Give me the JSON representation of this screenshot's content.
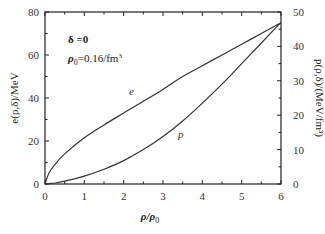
{
  "chart_data": {
    "type": "line",
    "title": "",
    "xlabel": "ρ/ρ0",
    "ylabel_left": "e(ρ,δ)/MeV",
    "ylabel_right": "p(ρ,δ)/(MeV/fm³)",
    "xlim": [
      0,
      6
    ],
    "ylim_left": [
      0,
      80
    ],
    "ylim_right": [
      0,
      50
    ],
    "x_ticks": [
      0,
      1,
      2,
      3,
      4,
      5,
      6
    ],
    "y_ticks_left": [
      0,
      20,
      40,
      60,
      80
    ],
    "y_ticks_right": [
      0,
      10,
      20,
      30,
      40,
      50
    ],
    "grid": false,
    "annotations": [
      "δ =0",
      "ρ0=0.16/fm³"
    ],
    "series": [
      {
        "name": "e",
        "axis": "left",
        "x": [
          0,
          0.1,
          0.25,
          0.5,
          1,
          1.5,
          2,
          2.5,
          3,
          3.5,
          4,
          4.5,
          5,
          5.5,
          6
        ],
        "values": [
          0,
          5,
          9,
          14,
          21.5,
          27.5,
          33,
          38.5,
          44,
          50,
          55,
          60,
          65,
          70,
          75
        ]
      },
      {
        "name": "p",
        "axis": "right",
        "x": [
          0,
          0.25,
          0.5,
          1,
          1.5,
          2,
          2.5,
          3,
          3.5,
          4,
          4.5,
          5,
          5.5,
          6
        ],
        "values": [
          0,
          0.3,
          0.8,
          2.3,
          4.3,
          6.8,
          10,
          13.8,
          18.3,
          23.5,
          29,
          35,
          41,
          47
        ]
      }
    ]
  },
  "labels": {
    "annot_delta": "δ =0",
    "annot_rho0": "ρ",
    "annot_rho0_sub": "0",
    "annot_rho0_val": "=0.16/fm",
    "annot_rho0_sup": "3",
    "curve_e": "e",
    "curve_p": "p",
    "xlabel_main": "ρ/ρ",
    "xlabel_sub": "0",
    "ylabel_left": "e(ρ,δ)/MeV",
    "ylabel_right": "p(ρ,δ)/(MeV/fm³)"
  }
}
